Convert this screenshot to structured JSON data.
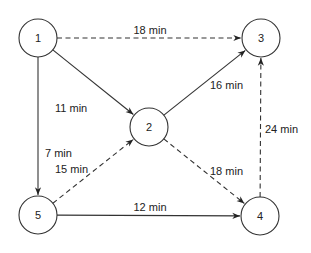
{
  "diagram": {
    "type": "directed-network",
    "nodes": [
      {
        "id": "1",
        "label": "1"
      },
      {
        "id": "2",
        "label": "2"
      },
      {
        "id": "3",
        "label": "3"
      },
      {
        "id": "4",
        "label": "4"
      },
      {
        "id": "5",
        "label": "5"
      }
    ],
    "edges": [
      {
        "from": "1",
        "to": "3",
        "label": "18 min",
        "style": "dashed"
      },
      {
        "from": "1",
        "to": "2",
        "label": "11 min",
        "style": "solid"
      },
      {
        "from": "1",
        "to": "5",
        "label": "7 min",
        "style": "solid"
      },
      {
        "from": "2",
        "to": "3",
        "label": "16 min",
        "style": "solid"
      },
      {
        "from": "2",
        "to": "4",
        "label": "18 min",
        "style": "dashed"
      },
      {
        "from": "5",
        "to": "2",
        "label": "15 min",
        "style": "dashed"
      },
      {
        "from": "5",
        "to": "4",
        "label": "12 min",
        "style": "solid"
      },
      {
        "from": "4",
        "to": "3",
        "label": "24 min",
        "style": "dashed"
      }
    ]
  }
}
